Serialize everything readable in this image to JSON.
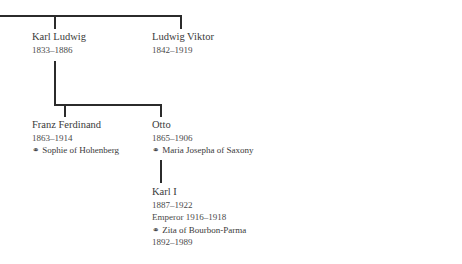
{
  "tree": {
    "generation1": [
      {
        "name": "Karl Ludwig",
        "dates": "1833–1886"
      },
      {
        "name": "Ludwig Viktor",
        "dates": "1842–1919"
      }
    ],
    "generation2": [
      {
        "name": "Franz Ferdinand",
        "dates": "1863–1914",
        "spouse": "⚭ Sophie of Hohenberg"
      },
      {
        "name": "Otto",
        "dates": "1865–1906",
        "spouse": "⚭ Maria Josepha of Saxony"
      }
    ],
    "generation3": [
      {
        "name": "Karl I",
        "dates": "1887–1922",
        "title": "Emperor 1916–1918",
        "spouse": "⚭ Zita of Bourbon-Parma",
        "spouse_dates": "1892–1989"
      }
    ]
  },
  "colors": {
    "line": "#2b2b2b",
    "text": "#3a3a3a",
    "background": "#ffffff"
  }
}
